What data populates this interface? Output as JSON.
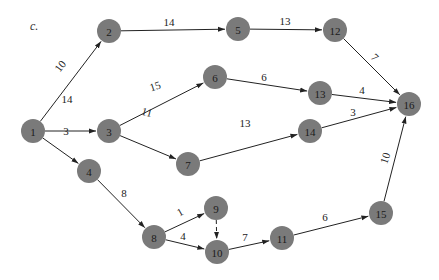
{
  "figure_label": "c.",
  "colors": {
    "node_fill": "#7a7a7a",
    "edge": "#222222",
    "text": "#1a1a1a"
  },
  "nodes": [
    {
      "id": "1",
      "x": 33,
      "y": 131
    },
    {
      "id": "2",
      "x": 109,
      "y": 31
    },
    {
      "id": "3",
      "x": 109,
      "y": 131
    },
    {
      "id": "4",
      "x": 89,
      "y": 171
    },
    {
      "id": "5",
      "x": 238,
      "y": 29
    },
    {
      "id": "6",
      "x": 215,
      "y": 77
    },
    {
      "id": "7",
      "x": 188,
      "y": 164
    },
    {
      "id": "8",
      "x": 154,
      "y": 237
    },
    {
      "id": "9",
      "x": 216,
      "y": 208
    },
    {
      "id": "10",
      "x": 217,
      "y": 252
    },
    {
      "id": "11",
      "x": 282,
      "y": 238
    },
    {
      "id": "12",
      "x": 335,
      "y": 30
    },
    {
      "id": "13",
      "x": 320,
      "y": 93
    },
    {
      "id": "14",
      "x": 310,
      "y": 131
    },
    {
      "id": "15",
      "x": 381,
      "y": 213
    },
    {
      "id": "16",
      "x": 409,
      "y": 104
    }
  ],
  "edges": [
    {
      "from": "1",
      "to": "2",
      "weight": "10",
      "lx": 60,
      "ly": 66,
      "rot": -52
    },
    {
      "from": "1",
      "to": "3",
      "weight": "14",
      "lx": 67,
      "ly": 99,
      "rot": 0
    },
    {
      "from": "1",
      "to": "4",
      "weight": "3",
      "lx": 66,
      "ly": 131,
      "rot": 0
    },
    {
      "from": "2",
      "to": "5",
      "weight": "14",
      "lx": 169,
      "ly": 22,
      "rot": 0
    },
    {
      "from": "5",
      "to": "12",
      "weight": "13",
      "lx": 285,
      "ly": 21,
      "rot": 0
    },
    {
      "from": "3",
      "to": "6",
      "weight": "15",
      "lx": 155,
      "ly": 86,
      "rot": -18
    },
    {
      "from": "3",
      "to": "7",
      "weight": "11",
      "lx": 147,
      "ly": 112,
      "rot": 15
    },
    {
      "from": "6",
      "to": "13",
      "weight": "6",
      "lx": 264,
      "ly": 77,
      "rot": 0
    },
    {
      "from": "7",
      "to": "14",
      "weight": "13",
      "lx": 245,
      "ly": 123,
      "rot": 0
    },
    {
      "from": "12",
      "to": "16",
      "weight": "7",
      "lx": 375,
      "ly": 57,
      "rot": 45
    },
    {
      "from": "13",
      "to": "16",
      "weight": "4",
      "lx": 362,
      "ly": 90,
      "rot": 0
    },
    {
      "from": "14",
      "to": "16",
      "weight": "3",
      "lx": 353,
      "ly": 112,
      "rot": 0
    },
    {
      "from": "4",
      "to": "8",
      "weight": "8",
      "lx": 124,
      "ly": 193,
      "rot": 0
    },
    {
      "from": "8",
      "to": "9",
      "weight": "1",
      "lx": 180,
      "ly": 212,
      "rot": -30
    },
    {
      "from": "8",
      "to": "10",
      "weight": "4",
      "lx": 183,
      "ly": 236,
      "rot": 0
    },
    {
      "from": "9",
      "to": "10",
      "weight": "",
      "dashed": true,
      "lx": 0,
      "ly": 0,
      "rot": 0
    },
    {
      "from": "10",
      "to": "11",
      "weight": "7",
      "lx": 245,
      "ly": 237,
      "rot": 0
    },
    {
      "from": "11",
      "to": "15",
      "weight": "6",
      "lx": 325,
      "ly": 217,
      "rot": 0
    },
    {
      "from": "15",
      "to": "16",
      "weight": "10",
      "lx": 385,
      "ly": 158,
      "rot": -72
    }
  ],
  "node_radius": 12
}
